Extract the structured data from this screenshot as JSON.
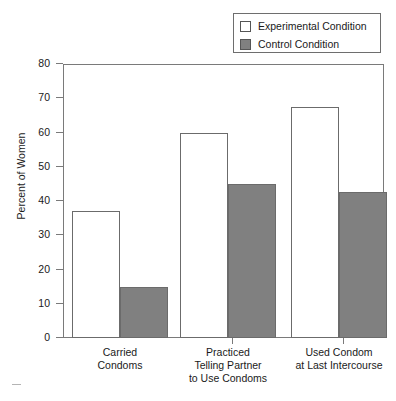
{
  "chart_data": {
    "type": "bar",
    "title": "",
    "xlabel": "",
    "ylabel": "Percent of Women",
    "ylim": [
      0,
      80
    ],
    "ytick_values": [
      80,
      70,
      60,
      50,
      40,
      30,
      20,
      10,
      0
    ],
    "grid": false,
    "legend_position": "top-right",
    "categories": [
      "Carried\nCondoms",
      "Practiced\nTelling Partner\nto Use Condoms",
      "Used Condom\nat Last Intercourse"
    ],
    "category_lines": [
      [
        "Carried",
        "Condoms"
      ],
      [
        "Practiced",
        "Telling Partner",
        "to Use Condoms"
      ],
      [
        "Used Condom",
        "at Last Intercourse"
      ]
    ],
    "series": [
      {
        "name": "Experimental Condition",
        "color": "#ffffff",
        "values": [
          37,
          60,
          67.5
        ]
      },
      {
        "name": "Control Condition",
        "color": "#808080",
        "values": [
          15,
          45,
          42.5
        ]
      }
    ]
  },
  "legend": {
    "items": [
      {
        "label": "Experimental Condition",
        "swatch": "white"
      },
      {
        "label": "Control Condition",
        "swatch": "gray"
      }
    ]
  },
  "axis": {
    "y_title": "Percent of Women",
    "y_labels": [
      "80",
      "70",
      "60",
      "50",
      "40",
      "30",
      "20",
      "10",
      "0"
    ]
  }
}
